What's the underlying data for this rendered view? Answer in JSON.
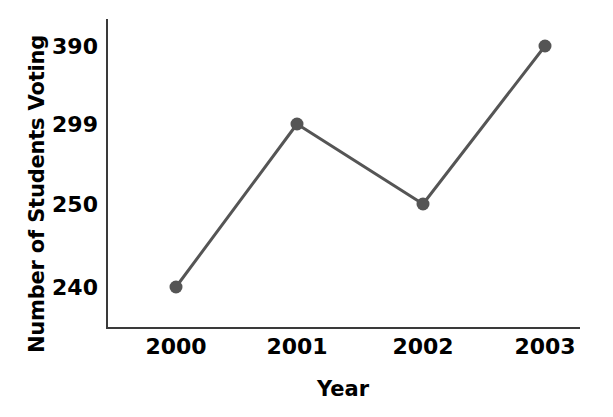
{
  "chart_data": {
    "type": "line",
    "title": "",
    "xlabel": "Year",
    "ylabel": "Number of Students Voting",
    "categories": [
      "2000",
      "2001",
      "2002",
      "2003"
    ],
    "values": [
      240,
      299,
      250,
      390
    ],
    "series": [
      {
        "name": "Number of Students Voting",
        "values": [
          240,
          299,
          250,
          390
        ]
      }
    ],
    "ytick_labels": [
      "390",
      "299",
      "250",
      "240"
    ],
    "xtick_labels": [
      "2000",
      "2001",
      "2002",
      "2003"
    ],
    "ylim": [
      240,
      390
    ],
    "grid": false,
    "legend": "none",
    "marker": "filled-circle",
    "line_color": "#555555",
    "marker_color": "#555555",
    "axis_color": "#3a3a3a",
    "text_color": "#000000",
    "background_color": "#ffffff",
    "points": [
      {
        "x": "2000",
        "y": 240,
        "px": 176,
        "py": 287
      },
      {
        "x": "2001",
        "y": 299,
        "px": 297,
        "py": 124
      },
      {
        "x": "2002",
        "y": 250,
        "px": 423,
        "py": 204
      },
      {
        "x": "2003",
        "y": 390,
        "px": 545,
        "py": 46
      }
    ],
    "ytick_positions": [
      {
        "label": "390",
        "py": 46
      },
      {
        "label": "299",
        "py": 124
      },
      {
        "label": "250",
        "py": 204
      },
      {
        "label": "240",
        "py": 287
      }
    ]
  }
}
